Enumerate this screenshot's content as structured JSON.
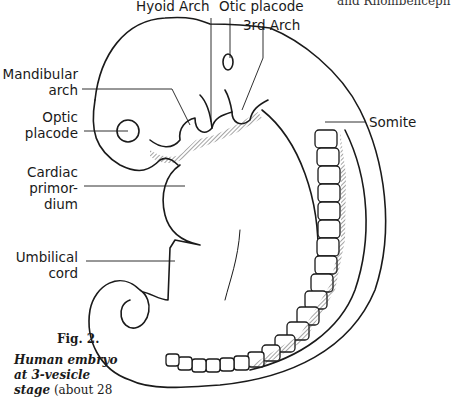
{
  "figure": {
    "number_label": "Fig. 2.",
    "caption_emphasis_1": "Human embryo",
    "caption_emphasis_2": "at 3-vesicle",
    "caption_emphasis_3": "stage",
    "caption_rest": "(about 28",
    "overflow_text_top_right": "and Rhombenceph"
  },
  "labels": {
    "hyoid_arch": "Hyoid Arch",
    "otic_placode": "Otic placode",
    "third_arch": "3rd Arch",
    "mandibular_1": "Mandibular",
    "mandibular_2": "arch",
    "optic_1": "Optic",
    "optic_2": "placode",
    "cardiac_1": "Cardiac",
    "cardiac_2": "primor-",
    "cardiac_3": "dium",
    "umbilical_1": "Umbilical",
    "umbilical_2": "cord",
    "somite": "Somite"
  },
  "colors": {
    "ink": "#1a1a1a",
    "background": "#ffffff"
  }
}
